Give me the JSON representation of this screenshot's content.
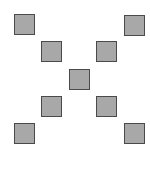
{
  "canvas": {
    "width": 150,
    "height": 170,
    "background": "#ffffff"
  },
  "squares": [
    {
      "id": "top-left",
      "x": 14,
      "y": 14
    },
    {
      "id": "top-right",
      "x": 124,
      "y": 15
    },
    {
      "id": "upper-mid-left",
      "x": 41,
      "y": 41
    },
    {
      "id": "upper-mid-right",
      "x": 96,
      "y": 41
    },
    {
      "id": "center",
      "x": 69,
      "y": 69
    },
    {
      "id": "lower-mid-left",
      "x": 41,
      "y": 96
    },
    {
      "id": "lower-mid-right",
      "x": 96,
      "y": 96
    },
    {
      "id": "bottom-left",
      "x": 14,
      "y": 123
    },
    {
      "id": "bottom-right",
      "x": 124,
      "y": 123
    }
  ],
  "colors": {
    "fill": "#a8a8a8",
    "border": "#4a4a4a"
  }
}
